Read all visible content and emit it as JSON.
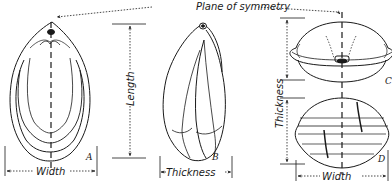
{
  "title_label": "Plane of symmetry",
  "dimensions": {
    "length": "Length",
    "width_a": "Width",
    "thickness_b": "Thickness",
    "thickness_cd": "Thickness",
    "width_d": "Width"
  },
  "figures": [
    {
      "id": "A",
      "view": "front outline with growth lines"
    },
    {
      "id": "B",
      "view": "side view"
    },
    {
      "id": "C",
      "view": "top view"
    },
    {
      "id": "D",
      "view": "bottom view"
    }
  ],
  "colors": {
    "ink": "#1a1a1a",
    "paper": "#ffffff"
  }
}
